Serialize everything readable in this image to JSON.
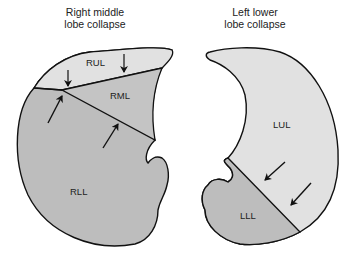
{
  "diagram": {
    "left": {
      "title_line1": "Right middle",
      "title_line2": "lobe collapse",
      "lobes": [
        {
          "label": "RUL",
          "color": "#e1e1e1"
        },
        {
          "label": "RML",
          "color": "#c4c4c4"
        },
        {
          "label": "RLL",
          "color": "#bdbdbd"
        }
      ],
      "arrows": 4
    },
    "right": {
      "title_line1": "Left lower",
      "title_line2": "lobe collapse",
      "lobes": [
        {
          "label": "LUL",
          "color": "#e1e1e1"
        },
        {
          "label": "LLL",
          "color": "#bdbdbd"
        }
      ],
      "arrows": 2
    },
    "outline_color": "#111111"
  }
}
